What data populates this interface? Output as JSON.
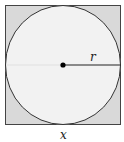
{
  "diagram": {
    "labels": {
      "radius": "r",
      "side": "x"
    },
    "colors": {
      "square_fill": "#d9d9d9",
      "circle_fill": "#f2f2f2",
      "stroke": "#333333",
      "center_dot": "#000000"
    }
  }
}
